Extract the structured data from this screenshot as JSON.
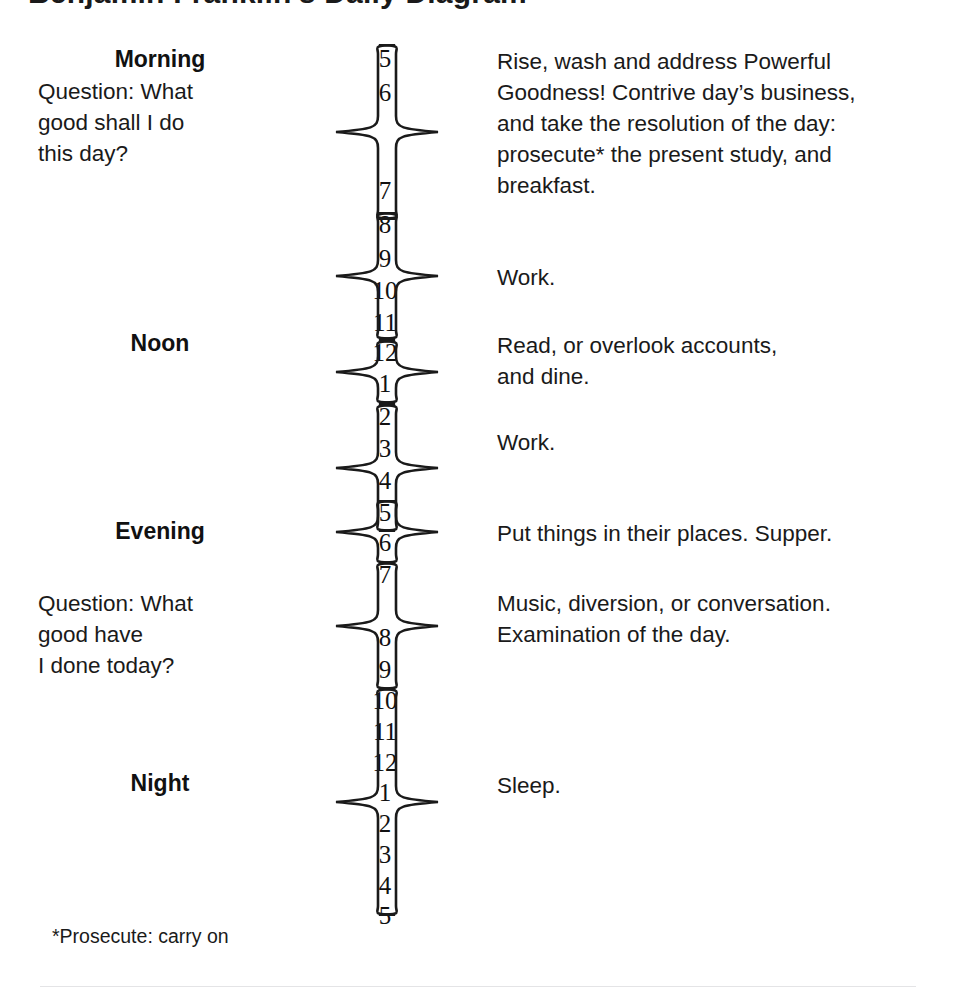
{
  "document": {
    "title_partial": "Benjamin Franklin's Daily Diagram",
    "footnote": "*Prosecute: carry on"
  },
  "periods": [
    {
      "label": "Morning",
      "top": 46
    },
    {
      "label": "Noon",
      "top": 330
    },
    {
      "label": "Evening",
      "top": 518
    },
    {
      "label": "Night",
      "top": 770
    }
  ],
  "questions": [
    {
      "top": 76,
      "lines": [
        "Question: What",
        "good shall I do",
        "this day?"
      ]
    },
    {
      "top": 588,
      "lines": [
        "Question: What",
        "good have",
        "I done today?"
      ]
    }
  ],
  "hours": [
    {
      "value": "5",
      "top": 46
    },
    {
      "value": "6",
      "top": 80
    },
    {
      "value": "7",
      "top": 178
    },
    {
      "value": "8",
      "top": 212
    },
    {
      "value": "9",
      "top": 246
    },
    {
      "value": "10",
      "top": 278
    },
    {
      "value": "11",
      "top": 310
    },
    {
      "value": "12",
      "top": 340
    },
    {
      "value": "1",
      "top": 371
    },
    {
      "value": "2",
      "top": 404
    },
    {
      "value": "3",
      "top": 436
    },
    {
      "value": "4",
      "top": 468
    },
    {
      "value": "5",
      "top": 500
    },
    {
      "value": "6",
      "top": 530
    },
    {
      "value": "7",
      "top": 562
    },
    {
      "value": "8",
      "top": 625
    },
    {
      "value": "9",
      "top": 657
    },
    {
      "value": "10",
      "top": 688
    },
    {
      "value": "11",
      "top": 719
    },
    {
      "value": "12",
      "top": 750
    },
    {
      "value": "1",
      "top": 780
    },
    {
      "value": "2",
      "top": 811
    },
    {
      "value": "3",
      "top": 842
    },
    {
      "value": "4",
      "top": 873
    },
    {
      "value": "5",
      "top": 903
    }
  ],
  "brace_groups": [
    {
      "name": "morning-rise",
      "top": 44,
      "height": 176,
      "hours": "5 to 8"
    },
    {
      "name": "morning-work",
      "top": 212,
      "height": 128,
      "hours": "8 to 12"
    },
    {
      "name": "noon-read-dine",
      "top": 340,
      "height": 64,
      "hours": "12 to 1"
    },
    {
      "name": "afternoon-work",
      "top": 404,
      "height": 128,
      "hours": "2 to 5"
    },
    {
      "name": "evening-supper",
      "top": 500,
      "height": 64,
      "hours": "5 to 7"
    },
    {
      "name": "evening-music",
      "top": 562,
      "height": 128,
      "hours": "7 to 10"
    },
    {
      "name": "night-sleep",
      "top": 688,
      "height": 228,
      "hours": "10 to 5"
    }
  ],
  "descriptions": [
    {
      "name": "morning-activities",
      "top": 46,
      "lines": [
        "Rise, wash and address Powerful",
        "Goodness! Contrive day’s business,",
        "and take the resolution of the day:",
        "prosecute* the present study, and",
        "breakfast."
      ]
    },
    {
      "name": "morning-work",
      "top": 262,
      "lines": [
        "Work."
      ]
    },
    {
      "name": "noon-accounts",
      "top": 330,
      "lines": [
        "Read, or overlook accounts,",
        "and dine."
      ]
    },
    {
      "name": "afternoon-work",
      "top": 427,
      "lines": [
        "Work."
      ]
    },
    {
      "name": "evening-supper",
      "top": 518,
      "lines": [
        "Put things in their places. Supper."
      ]
    },
    {
      "name": "evening-music",
      "top": 588,
      "lines": [
        "Music, diversion, or conversation.",
        "Examination of the day."
      ]
    },
    {
      "name": "night-sleep",
      "top": 770,
      "lines": [
        "Sleep."
      ]
    }
  ],
  "colors": {
    "ink": "#1a1a1a",
    "page": "#ffffff",
    "rule": "#e4e4e6"
  }
}
